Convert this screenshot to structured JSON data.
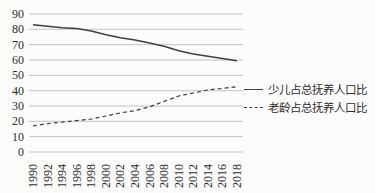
{
  "figure": {
    "background": "#fcfcfa"
  },
  "chart_data": {
    "type": "line",
    "x": [
      1990,
      1992,
      1994,
      1996,
      1998,
      2000,
      2002,
      2004,
      2006,
      2008,
      2010,
      2012,
      2014,
      2016,
      2018
    ],
    "series": [
      {
        "name": "少儿占总抚养人口比",
        "line_style": "solid",
        "values": [
          83,
          82,
          81,
          80.5,
          79,
          76.5,
          74.5,
          73,
          71,
          69,
          66,
          64,
          62.5,
          61,
          59.5
        ]
      },
      {
        "name": "老龄占总抚养人口比",
        "line_style": "dashed",
        "values": [
          17,
          18.5,
          19.5,
          20.5,
          21.5,
          23.5,
          25.5,
          27,
          29.5,
          33,
          36.5,
          38.5,
          40.5,
          41.5,
          42.5
        ]
      }
    ],
    "ylim": [
      0,
      90
    ],
    "ytick_step": 10,
    "ytick_labels": [
      "0",
      "10",
      "20",
      "30",
      "40",
      "50",
      "60",
      "70",
      "80",
      "90"
    ],
    "xtick_rotation": -90,
    "grid": "horizontal",
    "legend_position": "center-right",
    "colors": {
      "line": "#3f3f3f",
      "grid": "#bcbcbc",
      "text": "#2e2e2e"
    }
  }
}
